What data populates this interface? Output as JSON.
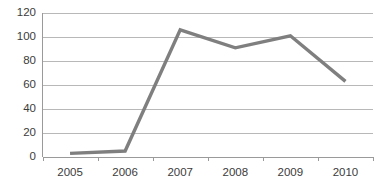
{
  "chart_data": {
    "type": "line",
    "title": "",
    "subtitle": "",
    "xlabel": "",
    "ylabel": "",
    "categories": [
      "2005",
      "2006",
      "2007",
      "2008",
      "2009",
      "2010"
    ],
    "x": [
      2005,
      2006,
      2007,
      2008,
      2009,
      2010
    ],
    "values": [
      3,
      5,
      106,
      91,
      101,
      63
    ],
    "series": [
      {
        "name": "",
        "color": "#7f7f7f",
        "values": [
          3,
          5,
          106,
          91,
          101,
          63
        ]
      }
    ],
    "xlim": [
      2005,
      2010
    ],
    "ylim": [
      0,
      120
    ],
    "ytick_labels": [
      "0",
      "20",
      "40",
      "60",
      "80",
      "100",
      "120"
    ],
    "ytick_values": [
      0,
      20,
      40,
      60,
      80,
      100,
      120
    ],
    "xtick_labels": [
      "2005",
      "2006",
      "2007",
      "2008",
      "2009",
      "2010"
    ],
    "grid": "horizontal",
    "legend": "none",
    "annotations": [],
    "colors": {
      "line": "#7f7f7f",
      "gridline": "#a6a6a6",
      "axis": "#9a9a9a",
      "tick_text": "#3b3b3b",
      "background": "#ffffff"
    }
  }
}
